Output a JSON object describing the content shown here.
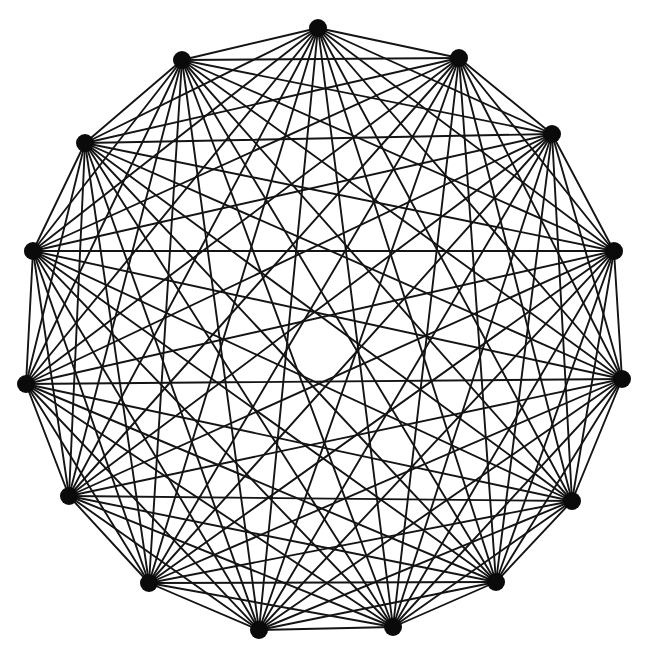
{
  "diagram": {
    "type": "complete-graph",
    "name": "K15",
    "node_count": 15,
    "edge_count": 105,
    "node_radius": 9,
    "edge_width": 1.9,
    "colors": {
      "background": "#ffffff",
      "edge": "#141414",
      "node": "#0a0a0a"
    },
    "nodes": [
      {
        "id": 1,
        "x": 318,
        "y": 28
      },
      {
        "id": 2,
        "x": 459,
        "y": 58
      },
      {
        "id": 3,
        "x": 552,
        "y": 134
      },
      {
        "id": 4,
        "x": 614,
        "y": 251
      },
      {
        "id": 5,
        "x": 622,
        "y": 379
      },
      {
        "id": 6,
        "x": 572,
        "y": 501
      },
      {
        "id": 7,
        "x": 496,
        "y": 582
      },
      {
        "id": 8,
        "x": 393,
        "y": 627
      },
      {
        "id": 9,
        "x": 259,
        "y": 630
      },
      {
        "id": 10,
        "x": 149,
        "y": 583
      },
      {
        "id": 11,
        "x": 69,
        "y": 496
      },
      {
        "id": 12,
        "x": 26,
        "y": 384
      },
      {
        "id": 13,
        "x": 33,
        "y": 251
      },
      {
        "id": 14,
        "x": 85,
        "y": 143
      },
      {
        "id": 15,
        "x": 182,
        "y": 60
      }
    ],
    "edges": "all-pairs"
  }
}
